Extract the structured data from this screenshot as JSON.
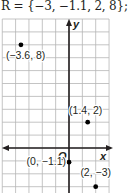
{
  "header": {
    "text": "R = {−3, −1.1, 2, 8}; yes"
  },
  "chart_data": {
    "type": "scatter",
    "title": "",
    "xlabel": "x",
    "ylabel": "y",
    "origin_label": "O",
    "xlim": [
      -5,
      3
    ],
    "ylim": [
      -3.4,
      10
    ],
    "grid": true,
    "points": [
      {
        "x": -3.6,
        "y": 8,
        "label": "(−3.6, 8)"
      },
      {
        "x": 1.4,
        "y": 2,
        "label": "(1.4, 2)"
      },
      {
        "x": 0,
        "y": -1.1,
        "label": "(0, −1.1)"
      },
      {
        "x": 2,
        "y": -3,
        "label": "(2, −3)"
      }
    ]
  },
  "colors": {
    "grid": "#b5b5b5",
    "axis": "#231f20",
    "point": "#000000"
  }
}
